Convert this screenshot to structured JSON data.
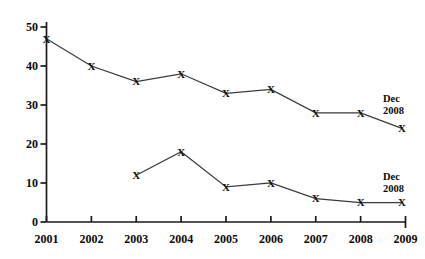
{
  "chart_data": {
    "type": "line",
    "title": "",
    "xlabel": "",
    "ylabel": "",
    "x": [
      "2001",
      "2002",
      "2003",
      "2004",
      "2005",
      "2006",
      "2007",
      "2008",
      "2009"
    ],
    "xlim": [
      2001,
      2009
    ],
    "ylim": [
      0,
      50
    ],
    "yticks": [
      0,
      10,
      20,
      30,
      40,
      50
    ],
    "xticks": [
      "2001",
      "2002",
      "2003",
      "2004",
      "2005",
      "2006",
      "2007",
      "2008",
      "2009"
    ],
    "grid": false,
    "legend": "none",
    "marker": "x",
    "series": [
      {
        "name": "upper-series",
        "points": [
          {
            "x": 2001.0,
            "y": 47
          },
          {
            "x": 2002.0,
            "y": 40
          },
          {
            "x": 2003.0,
            "y": 36
          },
          {
            "x": 2004.0,
            "y": 38
          },
          {
            "x": 2005.0,
            "y": 33
          },
          {
            "x": 2006.0,
            "y": 34
          },
          {
            "x": 2007.0,
            "y": 28
          },
          {
            "x": 2008.0,
            "y": 28
          },
          {
            "x": 2008.92,
            "y": 24
          }
        ],
        "end_annotation": {
          "line1": "Dec",
          "line2": "2008"
        }
      },
      {
        "name": "lower-series",
        "points": [
          {
            "x": 2003.0,
            "y": 12
          },
          {
            "x": 2004.0,
            "y": 18
          },
          {
            "x": 2005.0,
            "y": 9
          },
          {
            "x": 2006.0,
            "y": 10
          },
          {
            "x": 2007.0,
            "y": 6
          },
          {
            "x": 2008.0,
            "y": 5
          },
          {
            "x": 2008.92,
            "y": 5
          }
        ],
        "end_annotation": {
          "line1": "Dec",
          "line2": "2008"
        }
      }
    ]
  },
  "annotations": {
    "upper_dec": "Dec",
    "upper_year": "2008",
    "lower_dec": "Dec",
    "lower_year": "2008"
  },
  "axis": {
    "y_labels": [
      "50",
      "40",
      "30",
      "20",
      "10",
      "0"
    ],
    "x_labels": [
      "2001",
      "2002",
      "2003",
      "2004",
      "2005",
      "2006",
      "2007",
      "2008",
      "2009"
    ]
  },
  "colors": {
    "axis": "#1a1a1a",
    "line": "#3a3a3a",
    "marker": "#111111",
    "background": "#ffffff",
    "text": "#0a0a0a"
  }
}
